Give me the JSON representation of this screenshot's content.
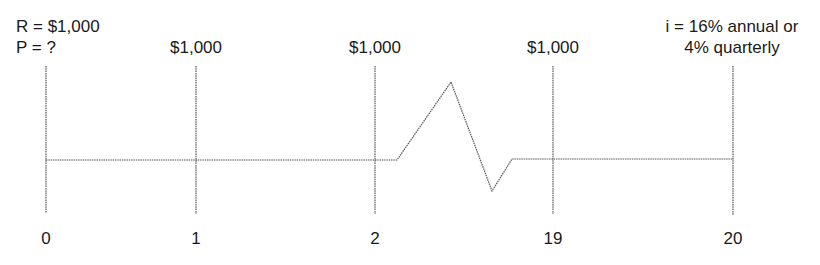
{
  "header_left": {
    "line1": "R = $1,000",
    "line2": "P = ?"
  },
  "header_right": {
    "line1": "i = 16% annual or",
    "line2": "4% quarterly"
  },
  "cashflows": [
    {
      "period": "1",
      "amount": "$1,000"
    },
    {
      "period": "2",
      "amount": "$1,000"
    },
    {
      "period": "19",
      "amount": "$1,000"
    }
  ],
  "periods": [
    "0",
    "1",
    "2",
    "19",
    "20"
  ],
  "colors": {
    "line": "#555555",
    "text": "#1a1a1a"
  }
}
